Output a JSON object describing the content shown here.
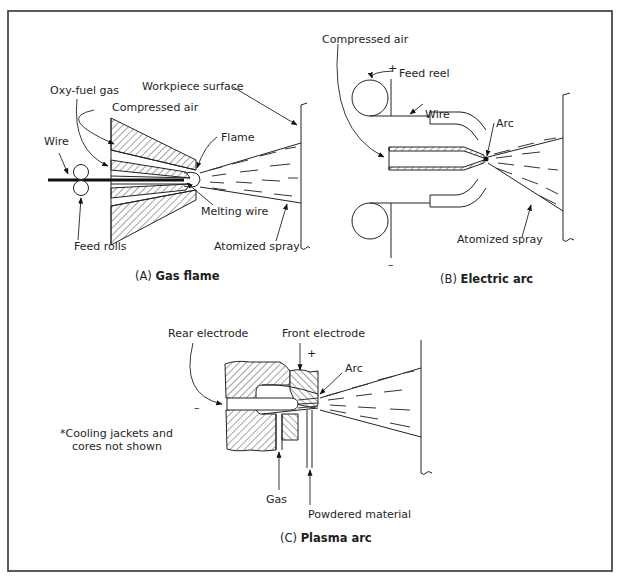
{
  "figure": {
    "panels": [
      {
        "id": "A",
        "caption_prefix": "(A)",
        "caption_title": "Gas flame",
        "labels": {
          "oxy_fuel_gas": "Oxy-fuel gas",
          "compressed_air": "Compressed air",
          "workpiece_surface": "Workpiece surface",
          "wire": "Wire",
          "flame": "Flame",
          "melting_wire": "Melting wire",
          "feed_rolls": "Feed rolls",
          "atomized_spray": "Atomized spray"
        }
      },
      {
        "id": "B",
        "caption_prefix": "(B)",
        "caption_title": "Electric arc",
        "labels": {
          "compressed_air": "Compressed air",
          "feed_reel": "Feed reel",
          "wire": "Wire",
          "arc": "Arc",
          "atomized_spray": "Atomized spray",
          "plus": "+",
          "minus": "–"
        }
      },
      {
        "id": "C",
        "caption_prefix": "(C)",
        "caption_title": "Plasma arc",
        "labels": {
          "rear_electrode": "Rear electrode",
          "front_electrode": "Front electrode",
          "arc": "Arc",
          "gas": "Gas",
          "powdered_material": "Powdered material",
          "plus": "+",
          "minus": "–",
          "note_line1": "*Cooling jackets and",
          "note_line2": "cores not shown"
        }
      }
    ]
  }
}
